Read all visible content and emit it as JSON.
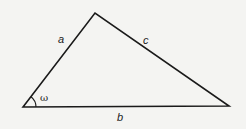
{
  "diagram": {
    "type": "triangle",
    "vertices": {
      "bottom_left": [
        23,
        107
      ],
      "top": [
        95,
        13
      ],
      "bottom_right": [
        229,
        106
      ]
    },
    "sides": {
      "a": "a",
      "b": "b",
      "c": "c"
    },
    "angle": "ω",
    "stroke_color": "#1a1a1a",
    "background": "#f4f4f2"
  }
}
